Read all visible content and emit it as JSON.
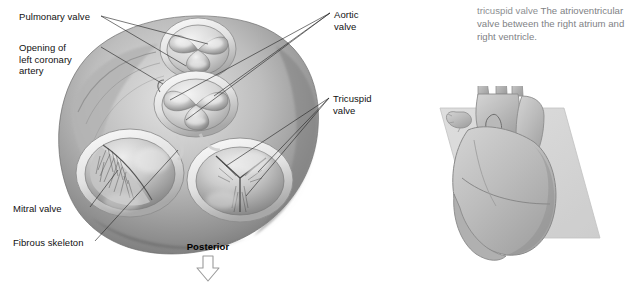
{
  "figure": {
    "name": "heart-valves-superior-view",
    "labels": [
      {
        "id": "pulmonary-valve",
        "text": "Pulmonary valve"
      },
      {
        "id": "left-coronary",
        "text": "Opening of\nleft coronary\nartery"
      },
      {
        "id": "aortic-valve",
        "text": "Aortic\nvalve"
      },
      {
        "id": "tricuspid-valve",
        "text": "Tricuspid\nvalve"
      },
      {
        "id": "mitral-valve",
        "text": "Mitral valve"
      },
      {
        "id": "fibrous-skeleton",
        "text": "Fibrous skeleton"
      }
    ],
    "orientation": {
      "text": "Posterior",
      "arrow_icon": "arrow-down-outline-icon"
    }
  },
  "glossary": {
    "term": "tricuspid valve",
    "definition": "  The atrioventricular valve between the right atrium and right ventricle.",
    "term_color": "#8d8f92",
    "definition_color": "#808285"
  },
  "thumbnail": {
    "name": "heart-section-plane-thumbnail",
    "caption": ""
  },
  "colors": {
    "background": "#ffffff",
    "label_text": "#111111",
    "leader_line": "#2b2b2b",
    "tissue_light": "#d9d9d9",
    "tissue_mid": "#9a9a9a",
    "tissue_dark": "#636363"
  }
}
